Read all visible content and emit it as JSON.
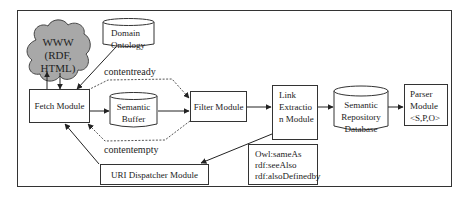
{
  "diagram": {
    "nodes": {
      "www": {
        "line1": "WWW",
        "line2": "(RDF,",
        "line3": "HTML)"
      },
      "domain_ontology": {
        "line1": "Domain",
        "line2": "Ontology"
      },
      "fetch_module": {
        "label": "Fetch Module"
      },
      "semantic_buffer": {
        "line1": "Semantic",
        "line2": "Buffer"
      },
      "filter_module": {
        "label": "Filter Module"
      },
      "link_extraction": {
        "line1": "Link",
        "line2": "Extractio",
        "line3": "n Module"
      },
      "semantic_repository": {
        "line1": "Semantic",
        "line2": "Repository",
        "line3": "Database"
      },
      "parser_module": {
        "line1": "Parser",
        "line2": "Module",
        "line3": "<S,P,O>"
      },
      "uri_dispatcher": {
        "label": "URI Dispatcher Module"
      },
      "owl_note": {
        "line1": "Owl:sameAs",
        "line2": "rdf:seeAlso",
        "line3": "rdf:alsoDefinedby"
      }
    },
    "edge_labels": {
      "contentready": "contentready",
      "contentempty": "contentempty"
    },
    "colors": {
      "cloud_fill": "#a8a8a8",
      "stroke": "#333333",
      "background": "#ffffff"
    }
  }
}
